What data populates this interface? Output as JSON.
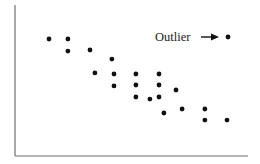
{
  "chart_data": {
    "type": "scatter",
    "title": "",
    "xlabel": "",
    "ylabel": "",
    "xlim": [
      0,
      10
    ],
    "ylim": [
      0,
      10
    ],
    "grid": false,
    "legend": null,
    "x_ticks": [],
    "y_ticks": [],
    "series": [
      {
        "name": "points",
        "points": [
          {
            "x": 1.46,
            "y": 7.75
          },
          {
            "x": 2.27,
            "y": 7.75
          },
          {
            "x": 2.27,
            "y": 6.95
          },
          {
            "x": 3.22,
            "y": 7.02
          },
          {
            "x": 4.16,
            "y": 6.42
          },
          {
            "x": 3.43,
            "y": 5.5
          },
          {
            "x": 4.25,
            "y": 5.43
          },
          {
            "x": 4.25,
            "y": 4.64
          },
          {
            "x": 5.19,
            "y": 5.43
          },
          {
            "x": 6.18,
            "y": 5.43
          },
          {
            "x": 5.19,
            "y": 4.7
          },
          {
            "x": 6.18,
            "y": 4.7
          },
          {
            "x": 6.91,
            "y": 4.37
          },
          {
            "x": 5.19,
            "y": 3.91
          },
          {
            "x": 5.79,
            "y": 3.77
          },
          {
            "x": 6.18,
            "y": 3.91
          },
          {
            "x": 6.39,
            "y": 2.85
          },
          {
            "x": 7.17,
            "y": 3.11
          },
          {
            "x": 8.15,
            "y": 3.11
          },
          {
            "x": 8.15,
            "y": 2.38
          },
          {
            "x": 9.1,
            "y": 2.38
          }
        ]
      },
      {
        "name": "outlier",
        "points": [
          {
            "x": 9.14,
            "y": 7.88
          }
        ]
      }
    ],
    "annotations": [
      {
        "text": "Outlier",
        "arrow": "→",
        "target": "outlier"
      }
    ]
  }
}
